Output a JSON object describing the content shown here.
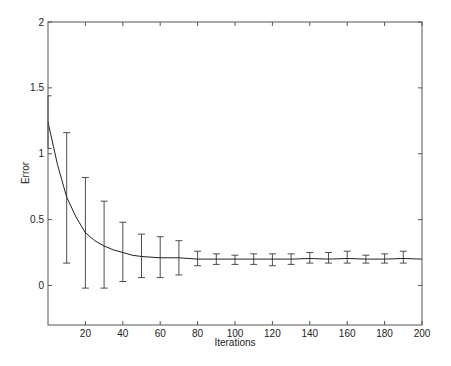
{
  "chart_data": {
    "type": "line",
    "title": "",
    "xlabel": "Iterations",
    "ylabel": "Error",
    "xlim": [
      0,
      200
    ],
    "ylim": [
      -0.3,
      2
    ],
    "xticks": [
      20,
      40,
      60,
      80,
      100,
      120,
      140,
      160,
      180,
      200
    ],
    "xtick_labels": [
      "20",
      "40",
      "60",
      "80",
      "100",
      "120",
      "140",
      "160",
      "180",
      "200"
    ],
    "yticks": [
      0,
      0.5,
      1,
      1.5,
      2
    ],
    "ytick_labels": [
      "0",
      "0.5",
      "1",
      "1.5",
      "2"
    ],
    "grid": false,
    "legend": null,
    "box": true,
    "series": [
      {
        "name": "mean error",
        "style": "solid line",
        "x": [
          0,
          5,
          10,
          15,
          20,
          25,
          30,
          35,
          40,
          45,
          50,
          60,
          70,
          80,
          90,
          100,
          110,
          120,
          130,
          140,
          150,
          160,
          170,
          180,
          190,
          200
        ],
        "y": [
          1.24,
          0.92,
          0.67,
          0.52,
          0.4,
          0.34,
          0.3,
          0.27,
          0.25,
          0.23,
          0.22,
          0.21,
          0.21,
          0.2,
          0.2,
          0.2,
          0.2,
          0.2,
          0.2,
          0.205,
          0.2,
          0.205,
          0.2,
          0.2,
          0.205,
          0.2
        ]
      }
    ],
    "error_bars": {
      "x": [
        0,
        10,
        20,
        30,
        40,
        50,
        60,
        70,
        80,
        90,
        100,
        110,
        120,
        130,
        140,
        150,
        160,
        170,
        180,
        190
      ],
      "upper": [
        1.44,
        1.16,
        0.82,
        0.64,
        0.48,
        0.39,
        0.37,
        0.34,
        0.26,
        0.24,
        0.23,
        0.24,
        0.24,
        0.24,
        0.25,
        0.25,
        0.26,
        0.23,
        0.24,
        0.26
      ],
      "lower": [
        1.04,
        0.17,
        -0.02,
        -0.02,
        0.03,
        0.06,
        0.06,
        0.08,
        0.15,
        0.16,
        0.16,
        0.16,
        0.15,
        0.16,
        0.17,
        0.17,
        0.17,
        0.17,
        0.17,
        0.17
      ]
    }
  }
}
